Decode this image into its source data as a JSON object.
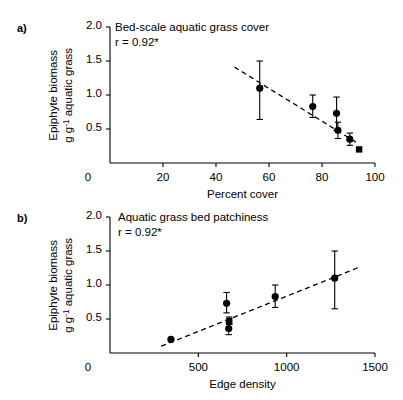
{
  "figure": {
    "background": "#ffffff",
    "marker_color": "#000000",
    "line_color": "#000000"
  },
  "chart_data": [
    {
      "type": "scatter",
      "panel_label": "a)",
      "title": "Bed-scale aquatic grass cover",
      "annotation": "r = 0.92*",
      "xlabel": "Percent cover",
      "ylabel_line1": "Epiphyte biomass",
      "ylabel_line2_pre": "g g",
      "ylabel_line2_sup": "-1",
      "ylabel_line2_post": " aquatic grass",
      "xlim": [
        0,
        100
      ],
      "ylim": [
        0,
        2.0
      ],
      "xticks": [
        0,
        20,
        40,
        60,
        80,
        100
      ],
      "xtick_labels": [
        "0",
        "20",
        "40",
        "60",
        "80",
        "100"
      ],
      "yticks": [
        0.5,
        1.0,
        1.5,
        2.0
      ],
      "ytick_labels": [
        "0.5",
        "1.0",
        "1.5",
        "2.0"
      ],
      "grid": false,
      "legend": "none",
      "points": [
        {
          "x": 56.5,
          "y": 1.1,
          "err_low": 0.46,
          "err_high": 0.4,
          "marker": "circle"
        },
        {
          "x": 76.5,
          "y": 0.83,
          "err_low": 0.16,
          "err_high": 0.17,
          "marker": "circle"
        },
        {
          "x": 85.5,
          "y": 0.73,
          "err_low": 0.25,
          "err_high": 0.24,
          "marker": "circle"
        },
        {
          "x": 86.0,
          "y": 0.48,
          "err_low": 0.12,
          "err_high": 0.12,
          "marker": "circle"
        },
        {
          "x": 90.5,
          "y": 0.35,
          "err_low": 0.09,
          "err_high": 0.09,
          "marker": "circle"
        },
        {
          "x": 94.0,
          "y": 0.2,
          "err_low": 0.0,
          "err_high": 0.0,
          "marker": "square"
        }
      ],
      "trend_line": {
        "style": "dashed",
        "x_start": 47.0,
        "y_start": 1.41,
        "x_end": 93.5,
        "y_end": 0.29
      }
    },
    {
      "type": "scatter",
      "panel_label": "b)",
      "title": "Aquatic grass bed patchiness",
      "annotation": "r = 0.92*",
      "xlabel": "Edge density",
      "ylabel_line1": "Epiphyte biomass",
      "ylabel_line2_pre": "g g",
      "ylabel_line2_sup": "-1",
      "ylabel_line2_post": " aquatic grass",
      "xlim": [
        0,
        1500
      ],
      "ylim": [
        0,
        2.0
      ],
      "xticks": [
        0,
        500,
        1000,
        1500
      ],
      "xtick_labels": [
        "0",
        "500",
        "1000",
        "1500"
      ],
      "yticks": [
        0.5,
        1.0,
        1.5,
        2.0
      ],
      "ytick_labels": [
        "0.5",
        "1.0",
        "1.5",
        "2.0"
      ],
      "grid": false,
      "legend": "none",
      "points": [
        {
          "x": 345,
          "y": 0.2,
          "err_low": 0.0,
          "err_high": 0.0,
          "marker": "circle"
        },
        {
          "x": 660,
          "y": 0.73,
          "err_low": 0.14,
          "err_high": 0.16,
          "marker": "circle"
        },
        {
          "x": 675,
          "y": 0.47,
          "err_low": 0.05,
          "err_high": 0.06,
          "marker": "square"
        },
        {
          "x": 672,
          "y": 0.36,
          "err_low": 0.09,
          "err_high": 0.08,
          "marker": "circle"
        },
        {
          "x": 935,
          "y": 0.83,
          "err_low": 0.16,
          "err_high": 0.17,
          "marker": "circle"
        },
        {
          "x": 1272,
          "y": 1.1,
          "err_low": 0.45,
          "err_high": 0.4,
          "marker": "circle"
        }
      ],
      "trend_line": {
        "style": "dashed",
        "x_start": 290,
        "y_start": 0.1,
        "x_end": 1410,
        "y_end": 1.26
      }
    }
  ]
}
